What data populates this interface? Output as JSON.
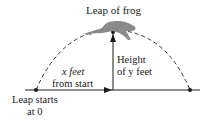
{
  "title": "Leap of frog",
  "labels": {
    "horizontal": [
      "x feet",
      "from start"
    ],
    "vertical": [
      "Height",
      "of y feet"
    ],
    "start": [
      "Leap starts",
      "at 0"
    ]
  },
  "icons": {
    "frog": "frog-illustration"
  },
  "colors": {
    "line": "#1a1a1a",
    "frog": "#8a8a8a"
  }
}
